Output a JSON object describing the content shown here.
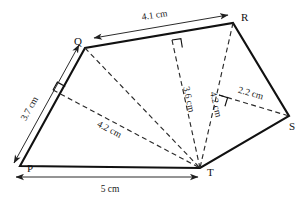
{
  "figure": {
    "background_color": "#ffffff",
    "line_color": "#111111",
    "vertices": [
      {
        "name": "P",
        "label": "P",
        "x": 20,
        "y": 166,
        "label_x": 27,
        "label_y": 172
      },
      {
        "name": "Q",
        "label": "Q",
        "x": 85,
        "y": 48,
        "label_x": 74,
        "label_y": 45
      },
      {
        "name": "R",
        "label": "R",
        "x": 233,
        "y": 23,
        "label_x": 241,
        "label_y": 21
      },
      {
        "name": "S",
        "label": "S",
        "x": 289,
        "y": 116,
        "label_x": 289,
        "label_y": 130
      },
      {
        "name": "T",
        "label": "T",
        "x": 200,
        "y": 168,
        "label_x": 207,
        "label_y": 176
      }
    ],
    "outline_order": [
      "P",
      "Q",
      "R",
      "S",
      "T"
    ],
    "diagonals": [
      {
        "name": "diagonal-q-t",
        "from": "Q",
        "to": "T"
      },
      {
        "name": "diagonal-r-t",
        "from": "R",
        "to": "T"
      }
    ],
    "altitudes": [
      {
        "name": "altitude-pq-to-t",
        "from_x": 53,
        "from_y": 90,
        "to_x": 200,
        "to_y": 168,
        "length": "4.2 cm"
      },
      {
        "name": "altitude-qr-to-t",
        "from_x": 172,
        "from_y": 40,
        "to_x": 200,
        "to_y": 168,
        "length": "3.6 cm"
      },
      {
        "name": "altitude-s-to-rt",
        "from_x": 219,
        "from_y": 95,
        "to_x": 289,
        "to_y": 116,
        "length": "2.2 cm"
      }
    ],
    "right_angles": [
      {
        "name": "right-angle-on-pq",
        "x": 53,
        "y": 90,
        "rotation": -61
      },
      {
        "name": "right-angle-on-qr",
        "x": 172,
        "y": 40,
        "rotation": -9
      },
      {
        "name": "right-angle-on-rt",
        "x": 219,
        "y": 95,
        "rotation": 17
      }
    ],
    "dimensions": [
      {
        "name": "dimension-qr",
        "value": "4.1 cm",
        "arrows": "both",
        "label_x": 155,
        "label_y": 18,
        "rotation": -9
      },
      {
        "name": "dimension-pq",
        "value": "3.7 cm",
        "arrows": "both",
        "label_x": 32,
        "label_y": 110,
        "rotation": -61
      },
      {
        "name": "dimension-pt",
        "value": "5 cm",
        "arrows": "both",
        "label_x": 110,
        "label_y": 192,
        "rotation": 0
      },
      {
        "name": "dimension-height-qr",
        "value": "3.6 cm",
        "label_x": 186,
        "label_y": 100,
        "rotation": 78
      },
      {
        "name": "dimension-height-pq",
        "value": "4.2 cm",
        "label_x": 108,
        "label_y": 132,
        "rotation": 28
      },
      {
        "name": "dimension-diagonal-rt",
        "value": "4.2 cm",
        "label_x": 213,
        "label_y": 105,
        "rotation": 77
      },
      {
        "name": "dimension-height-s",
        "value": "2.2 cm",
        "label_x": 250,
        "label_y": 96,
        "rotation": 16
      }
    ]
  }
}
